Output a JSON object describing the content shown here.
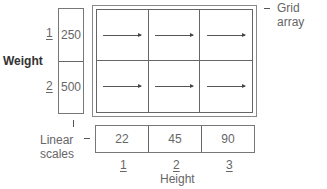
{
  "diagram": {
    "grid_label": "Grid array",
    "weight": {
      "title": "Weight",
      "indices": [
        "1",
        "2"
      ],
      "values": [
        "250",
        "500"
      ]
    },
    "height": {
      "title": "Height",
      "indices": [
        "1",
        "2",
        "3"
      ],
      "values": [
        "22",
        "45",
        "90"
      ]
    },
    "linear_scales_label": [
      "Linear",
      "scales"
    ],
    "grid": {
      "rows": 2,
      "cols": 3,
      "cell_icon": "right-arrow"
    }
  }
}
